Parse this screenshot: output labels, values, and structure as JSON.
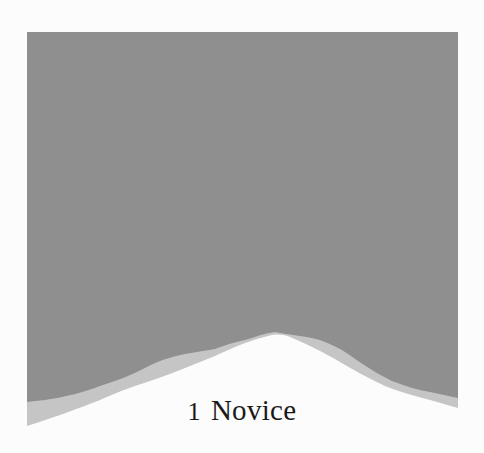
{
  "illustration": {
    "description": "Gray mountain silhouette illustration",
    "colors": {
      "background": "#fcfcfc",
      "sky": "#8f8f8f",
      "slope": "#c5c5c5",
      "snow": "#fcfcfc"
    }
  },
  "level": {
    "number": "1",
    "name": "Novice"
  }
}
